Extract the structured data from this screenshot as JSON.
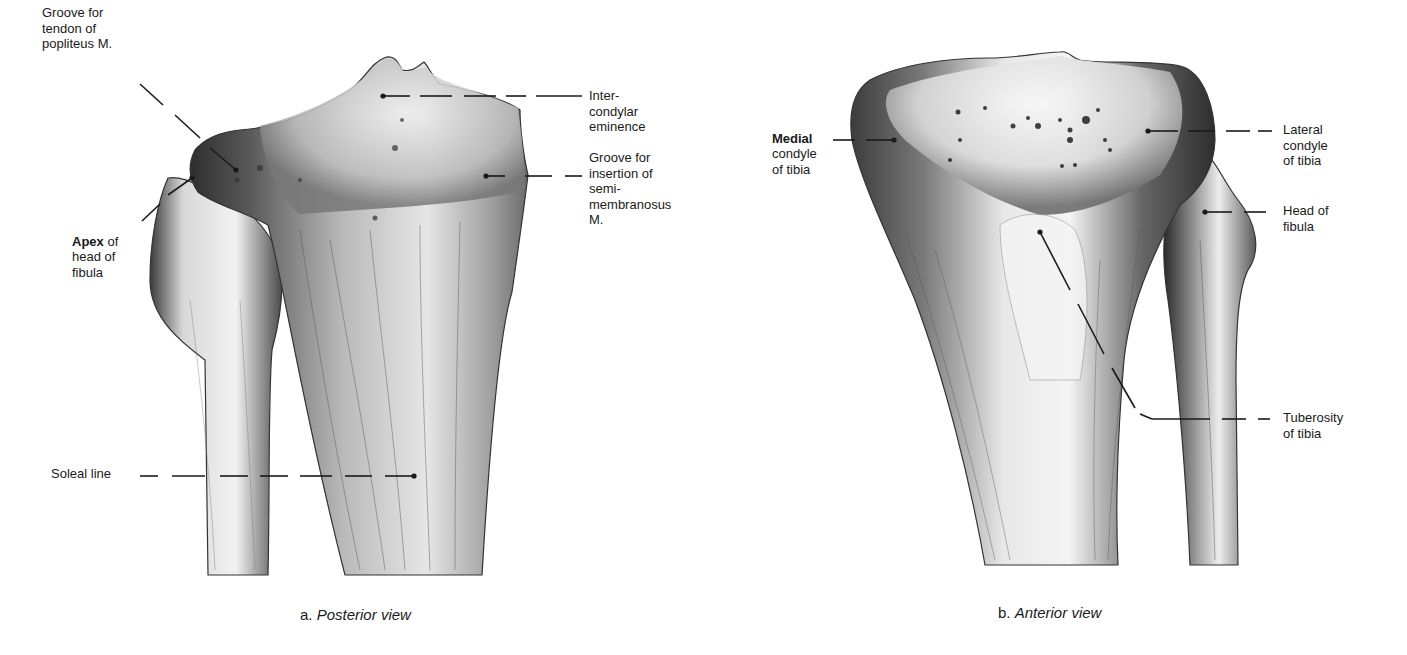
{
  "figure": {
    "panels": [
      {
        "id": "a",
        "caption_prefix": "a.",
        "caption_view": "Posterior view",
        "labels": {
          "popliteus_groove": "Groove for\ntendon of\npopliteus M.",
          "apex_bold": "Apex",
          "apex_rest": " of",
          "apex_line2": "head of\nfibula",
          "intercondylar": "Inter-\ncondylar\neminence",
          "semimembranosus": "Groove for\ninsertion of\nsemi-\nmembranosus\nM.",
          "soleal": "Soleal line"
        }
      },
      {
        "id": "b",
        "caption_prefix": "b.",
        "caption_view": "Anterior view",
        "labels": {
          "medial_bold": "Medial",
          "medial_rest": "condyle\nof tibia",
          "lateral": "Lateral\ncondyle\nof tibia",
          "head_fibula": "Head of\nfibula",
          "tuberosity": "Tuberosity\nof tibia"
        }
      }
    ],
    "colors": {
      "background": "#ffffff",
      "ink": "#1a1a1a",
      "bone_light": "#efefef",
      "bone_mid": "#a8a8a8",
      "bone_dark": "#3a3a3a"
    }
  }
}
